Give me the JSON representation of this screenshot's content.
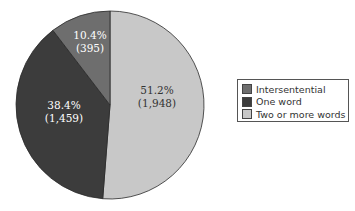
{
  "chart_data": {
    "type": "pie",
    "title": "",
    "categories": [
      "Intersentential",
      "One word",
      "Two or more words"
    ],
    "values": [
      395,
      1459,
      1948
    ],
    "percentages": [
      10.4,
      38.4,
      51.2
    ],
    "labels": [
      {
        "pct": "10.4%",
        "count": "(395)"
      },
      {
        "pct": "38.4%",
        "count": "(1,459)"
      },
      {
        "pct": "51.2%",
        "count": "(1,948)"
      }
    ],
    "colors": [
      "#6e6e6e",
      "#3c3c3c",
      "#c8c8c8"
    ],
    "start_angle_deg": 0,
    "direction": "counterclockwise-from-top for small slices; largest slice clockwise from top",
    "legend_position": "right"
  },
  "legend": {
    "items": [
      {
        "label": "Intersentential",
        "color": "#6e6e6e"
      },
      {
        "label": "One word",
        "color": "#3c3c3c"
      },
      {
        "label": "Two or more words",
        "color": "#c8c8c8"
      }
    ]
  }
}
